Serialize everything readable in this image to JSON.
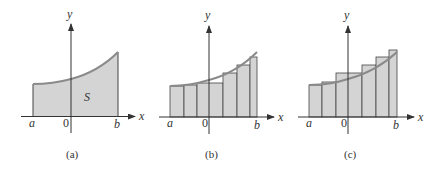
{
  "colors": {
    "fill": "#d4d4d4",
    "curve": "#8a8a8a",
    "axis": "#333333",
    "rect_stroke": "#444444"
  },
  "panels": [
    {
      "id": "a",
      "caption": "(a)",
      "x_label": "x",
      "y_label": "y",
      "a_label": "a",
      "origin_label": "0",
      "b_label": "b",
      "region_label": "S",
      "description": "Region S under curve y=f(x) from a to b"
    },
    {
      "id": "b",
      "caption": "(b)",
      "x_label": "x",
      "y_label": "y",
      "a_label": "a",
      "origin_label": "0",
      "b_label": "b",
      "description": "Lower rectangles (left endpoints), 6 subintervals"
    },
    {
      "id": "c",
      "caption": "(c)",
      "x_label": "x",
      "y_label": "y",
      "a_label": "a",
      "origin_label": "0",
      "b_label": "b",
      "description": "Upper rectangles (right endpoints), 6 subintervals"
    }
  ]
}
